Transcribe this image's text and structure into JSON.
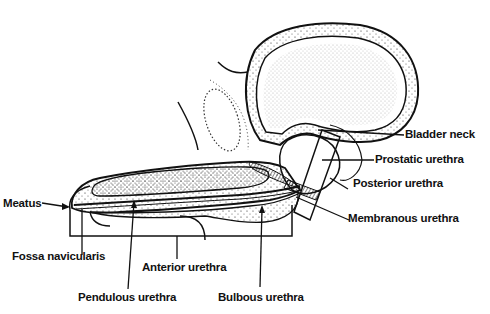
{
  "diagram": {
    "labels": {
      "bladder_neck": "Bladder neck",
      "prostatic_urethra": "Prostatic urethra",
      "posterior_urethra": "Posterior urethra",
      "membranous_urethra": "Membranous urethra",
      "meatus": "Meatus",
      "fossa_navicularis": "Fossa navicularis",
      "anterior_urethra": "Anterior urethra",
      "pendulous_urethra": "Pendulous urethra",
      "bulbous_urethra": "Bulbous urethra"
    },
    "colors": {
      "ink": "#111111",
      "background": "#ffffff"
    }
  }
}
